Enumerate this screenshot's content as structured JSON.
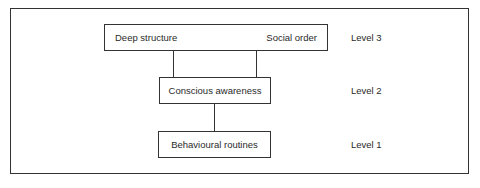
{
  "diagram": {
    "levels": [
      {
        "id": "level-3",
        "label": "Level 3",
        "box_left_text": "Deep structure",
        "box_right_text": "Social order"
      },
      {
        "id": "level-2",
        "label": "Level 2",
        "box_text": "Conscious awareness"
      },
      {
        "id": "level-1",
        "label": "Level 1",
        "box_text": "Behavioural routines"
      }
    ],
    "connections": [
      {
        "from": "Deep structure",
        "to": "Conscious awareness"
      },
      {
        "from": "Social order",
        "to": "Conscious awareness"
      },
      {
        "from": "Conscious awareness",
        "to": "Behavioural routines"
      }
    ],
    "colors": {
      "line": "#333333",
      "text": "#2a2a2a",
      "background": "#ffffff"
    }
  }
}
